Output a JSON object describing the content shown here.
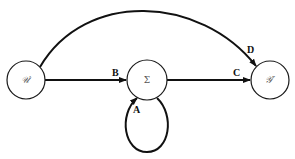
{
  "diagram": {
    "nodes": [
      {
        "id": "left",
        "label": "𝒰′"
      },
      {
        "id": "center",
        "label": "Σ"
      },
      {
        "id": "right",
        "label": "𝒴″"
      }
    ],
    "edges": [
      {
        "id": "B",
        "label": "B",
        "from": "left",
        "to": "center"
      },
      {
        "id": "C",
        "label": "C",
        "from": "center",
        "to": "right"
      },
      {
        "id": "A",
        "label": "A",
        "from": "center",
        "to": "center"
      },
      {
        "id": "D",
        "label": "D",
        "from": "left",
        "to": "right"
      }
    ],
    "colors": {
      "stroke": "#111111",
      "background": "#ffffff"
    }
  }
}
